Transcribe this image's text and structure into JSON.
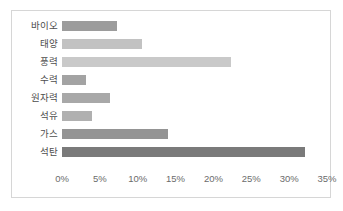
{
  "chart_data": {
    "type": "bar",
    "orientation": "horizontal",
    "title": "",
    "subtitle": "",
    "xlabel": "",
    "ylabel": "",
    "categories": [
      "바이오",
      "태양",
      "풍력",
      "수력",
      "원자력",
      "석유",
      "가스",
      "석탄"
    ],
    "values": [
      7.2,
      10.6,
      22.3,
      3.2,
      6.3,
      3.9,
      14.0,
      32.1
    ],
    "value_unit": "%",
    "xlim": [
      0,
      35
    ],
    "xticks": [
      0,
      5,
      10,
      15,
      20,
      25,
      30,
      35
    ],
    "xtick_labels": [
      "0%",
      "5%",
      "10%",
      "15%",
      "20%",
      "25%",
      "30%",
      "35%"
    ],
    "grid": false,
    "legend": false,
    "legend_position": "none",
    "bar_colors": [
      "#9c9c9c",
      "#c2c2c2",
      "#c9c9c9",
      "#a3a3a3",
      "#a8a8a8",
      "#b0b0b0",
      "#949494",
      "#7a7a7a"
    ],
    "frame_border_color": "#d6d6d6",
    "label_color": "#4d4d4d",
    "tick_color": "#6b6b6b",
    "background_color": "#ffffff"
  }
}
